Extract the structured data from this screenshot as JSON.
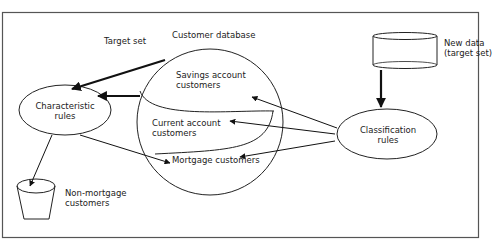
{
  "diagram": {
    "title": "Customer database",
    "nodes": {
      "characteristic_rules": "Characteristic\nrules",
      "classification_rules": "Classification\nrules",
      "savings": "Savings account\ncustomers",
      "current": "Current account\ncustomers",
      "mortgage": "Mortgage customers",
      "new_data": "New data\n(target set)",
      "non_mortgage": "Non-mortgage\ncustomers"
    },
    "edge_labels": {
      "target_set": "Target set"
    },
    "colors": {
      "stroke": "#222222",
      "frame": "#555555",
      "background": "#ffffff"
    }
  }
}
